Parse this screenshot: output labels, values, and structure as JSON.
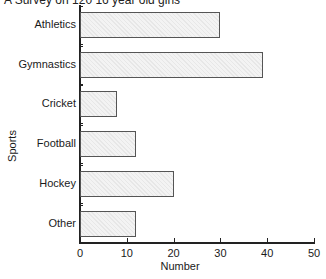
{
  "chart_data": {
    "type": "bar",
    "orientation": "horizontal",
    "title": "A Survey on 120 16 year old girls",
    "xlabel": "Number",
    "ylabel": "Sports",
    "categories": [
      "Athletics",
      "Gymnastics",
      "Cricket",
      "Football",
      "Hockey",
      "Other"
    ],
    "values": [
      30,
      39,
      8,
      12,
      20,
      12
    ],
    "xlim": [
      0,
      50
    ],
    "xticks": [
      "0",
      "10",
      "20",
      "30",
      "40",
      "50"
    ],
    "grid": false,
    "legend": null
  }
}
